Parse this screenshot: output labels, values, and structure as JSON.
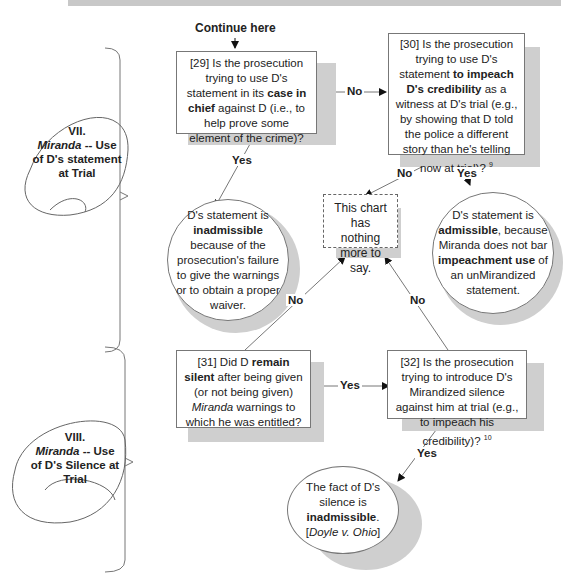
{
  "header": {
    "continue_label": "Continue here"
  },
  "sections": [
    {
      "number": "VII.",
      "title_italic": "Miranda",
      "title_rest": " -- Use of D's statement at Trial"
    },
    {
      "number": "VIII.",
      "title_italic": "Miranda",
      "title_rest": " -- Use of D's Silence at Trial"
    }
  ],
  "nodes": {
    "q29": {
      "pre": "[29] Is the prosecution trying to use D's statement in its ",
      "bold": "case in chief",
      "post": " against D (i.e., to help prove some element of the crime)?"
    },
    "q30": {
      "pre": "[30] Is the prosecution trying to use D's statement ",
      "bold": "to impeach D's credibility",
      "post": " as a witness at D's trial (e.g., by showing that D told the police a different story than he's telling now at trial)?",
      "footnote": "9"
    },
    "r_inadmissible": {
      "pre": "D's statement is ",
      "bold": "inadmissible",
      "post": " because of the prosecution's failure to give the warnings or to obtain a proper waiver."
    },
    "end": {
      "text": "This chart has nothing more to say."
    },
    "r_admissible": {
      "pre": "D's statement is ",
      "bold1": "admissible",
      "mid": ", because Miranda does not bar ",
      "bold2": "impeachment use",
      "post": " of an unMirandized statement."
    },
    "q31": {
      "pre": "[31] Did D ",
      "bold": "remain silent",
      "mid": " after being given (or not being given) ",
      "italic": "Miranda",
      "post": " warnings to which he was entitled?"
    },
    "q32": {
      "text": "[32] Is the prosecution trying to introduce D's Mirandized silence against him at trial (e.g., to impeach his credibility)?",
      "footnote": "10"
    },
    "r_silence": {
      "pre": "The fact of D's silence is ",
      "bold": "inadmissible",
      "post": ".",
      "case_open": "[",
      "case_italic": "Doyle v. Ohio",
      "case_close": "]"
    }
  },
  "edge_labels": {
    "q29_no": "No",
    "q29_yes": "Yes",
    "q30_no": "No",
    "q30_yes": "Yes",
    "q31_no": "No",
    "q31_yes": "Yes",
    "q32_no": "No",
    "q32_yes": "Yes"
  }
}
